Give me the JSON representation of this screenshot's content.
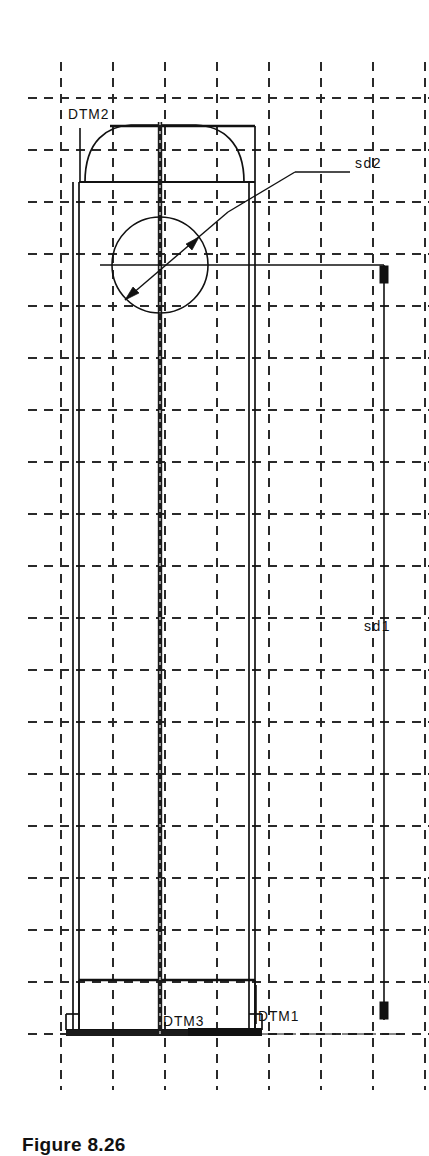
{
  "drawing": {
    "background_color": "#ffffff",
    "line_color": "#111111",
    "grid_color": "#2a2a2a",
    "type": "cad-orthographic-view",
    "description": "Tall vertical extruded part with domed top, central circular hole, stepped base and datum planes"
  },
  "datums": [
    {
      "id": "dtm2",
      "label": "DTM2"
    },
    {
      "id": "dtm3",
      "label": "DTM3"
    },
    {
      "id": "dtm1",
      "label": "DTM1"
    }
  ],
  "dimensions": [
    {
      "id": "sd2",
      "label": "sd2",
      "kind": "diameter"
    },
    {
      "id": "sd1",
      "label": "sd1",
      "kind": "linear-vertical"
    }
  ],
  "caption": {
    "text": "Figure 8.26"
  },
  "geometry": {
    "grid_spacing": 52,
    "hole": {
      "cx": 160,
      "cy": 265,
      "r": 48
    },
    "body": {
      "left": 73,
      "right": 255,
      "top": 125,
      "bottom": 1032
    },
    "dimension_line_x": 384,
    "dimension_line_top": 265,
    "dimension_line_bottom": 1020
  }
}
